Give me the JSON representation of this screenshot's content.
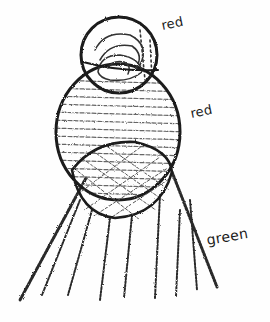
{
  "drawing": {
    "style": "pencil sketch",
    "colors": {
      "ink": "#1a1a1a",
      "shade": "#555555",
      "paper": "#fefefe"
    },
    "shapes": [
      {
        "id": "top-circle",
        "kind": "circle",
        "fill": "scribbled swirls",
        "label": "red"
      },
      {
        "id": "middle-oval",
        "kind": "oval",
        "fill": "horizontal hatching",
        "label": "red"
      },
      {
        "id": "lower-circle",
        "kind": "circle",
        "fill": "cross-hatching"
      },
      {
        "id": "fan-rays",
        "kind": "rays",
        "count": 8,
        "label": "green"
      }
    ]
  },
  "labels": {
    "top": "red",
    "middle": "red",
    "bottom": "green"
  }
}
